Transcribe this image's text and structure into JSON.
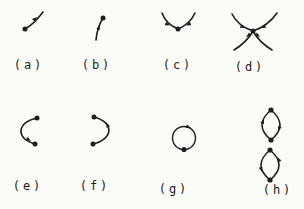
{
  "figure": {
    "colors": {
      "background": "#fbfbf8",
      "ink": "#1e1e1e"
    },
    "panels": [
      {
        "id": "a",
        "label": "(a)",
        "description": "single trajectory leaving a fixed point toward the upper right"
      },
      {
        "id": "b",
        "label": "(b)",
        "description": "single trajectory approaching a fixed point from below"
      },
      {
        "id": "c",
        "label": "(c)",
        "description": "two trajectories converging down onto a fixed point"
      },
      {
        "id": "d",
        "label": "(d)",
        "description": "four trajectories at a fixed point: in from above, out below"
      },
      {
        "id": "e",
        "label": "(e)",
        "description": "left half-circle arc joining two fixed points, flow downward"
      },
      {
        "id": "f",
        "label": "(f)",
        "description": "right half-circle arc joining two fixed points, flow upward"
      },
      {
        "id": "g",
        "label": "(g)",
        "description": "closed circular orbit with one fixed point, clockwise flow"
      },
      {
        "id": "h",
        "label": "(h)",
        "description": "two closed loops each with two fixed points, opposite circulation"
      }
    ]
  }
}
